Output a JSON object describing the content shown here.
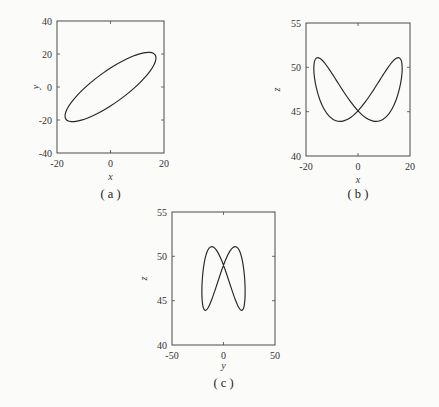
{
  "chart_data": [
    {
      "panel": "a",
      "type": "line",
      "caption": "( a )",
      "xlabel": "x",
      "ylabel": "y",
      "xlim": [
        -20,
        20
      ],
      "ylim": [
        -40,
        40
      ],
      "xticks": [
        -20,
        0,
        20
      ],
      "yticks": [
        -40,
        -20,
        0,
        20,
        40
      ],
      "grid": false,
      "x": [
        0,
        2.95,
        5.81,
        8.5,
        10.93,
        13.02,
        14.72,
        15.97,
        16.74,
        17,
        16.74,
        15.97,
        14.72,
        13.02,
        10.93,
        8.5,
        5.81,
        2.95,
        0,
        -2.95,
        -5.81,
        -8.5,
        -10.93,
        -13.02,
        -14.72,
        -15.97,
        -16.74,
        -17,
        -16.74,
        -15.97,
        -14.72,
        -13.02,
        -10.93,
        -8.5,
        -5.81,
        -2.95
      ],
      "y": [
        -11.5,
        -8.27,
        -4.8,
        -1.17,
        2.49,
        6.07,
        9.47,
        12.58,
        15.31,
        17.57,
        19.3,
        20.45,
        20.97,
        20.85,
        20.1,
        18.74,
        16.81,
        14.37,
        11.5,
        8.27,
        4.8,
        1.17,
        -2.49,
        -6.07,
        -9.47,
        -12.58,
        -15.31,
        -17.57,
        -19.3,
        -20.45,
        -20.97,
        -20.85,
        -20.1,
        -18.74,
        -16.81,
        -14.37
      ]
    },
    {
      "panel": "b",
      "type": "line",
      "caption": "( b )",
      "xlabel": "x",
      "ylabel": "z",
      "xlim": [
        -20,
        20
      ],
      "ylim": [
        40,
        55
      ],
      "xticks": [
        -20,
        0,
        20
      ],
      "yticks": [
        40,
        45,
        50,
        55
      ],
      "grid": false,
      "x": [
        0,
        2.95,
        5.81,
        8.5,
        10.93,
        13.02,
        14.72,
        15.97,
        16.74,
        17,
        16.74,
        15.97,
        14.72,
        13.02,
        10.93,
        8.5,
        5.81,
        2.95,
        0,
        -2.95,
        -5.81,
        -8.5,
        -10.93,
        -13.02,
        -14.72,
        -15.97,
        -16.74,
        -17,
        -16.74,
        -15.97,
        -14.72,
        -13.02,
        -10.93,
        -8.5,
        -5.81,
        -2.95
      ],
      "y": [
        45.1,
        46.16,
        47.38,
        48.62,
        49.72,
        50.56,
        51.02,
        51.06,
        50.68,
        49.9,
        48.84,
        47.62,
        46.38,
        45.28,
        44.44,
        43.98,
        43.94,
        44.32,
        45.1,
        46.16,
        47.38,
        48.62,
        49.72,
        50.56,
        51.02,
        51.06,
        50.68,
        49.9,
        48.84,
        47.62,
        46.38,
        45.28,
        44.44,
        43.98,
        43.94,
        44.32
      ]
    },
    {
      "panel": "c",
      "type": "line",
      "caption": "( c )",
      "xlabel": "y",
      "ylabel": "z",
      "xlim": [
        -50,
        50
      ],
      "ylim": [
        40,
        55
      ],
      "xticks": [
        -50,
        0,
        50
      ],
      "yticks": [
        40,
        45,
        50,
        55
      ],
      "grid": false,
      "x": [
        -11.5,
        -8.27,
        -4.8,
        -1.17,
        2.49,
        6.07,
        9.47,
        12.58,
        15.31,
        17.57,
        19.3,
        20.45,
        20.97,
        20.85,
        20.1,
        18.74,
        16.81,
        14.37,
        11.5,
        8.27,
        4.8,
        1.17,
        -2.49,
        -6.07,
        -9.47,
        -12.58,
        -15.31,
        -17.57,
        -19.3,
        -20.45,
        -20.97,
        -20.85,
        -20.1,
        -18.74,
        -16.81,
        -14.37
      ],
      "y": [
        45.1,
        46.16,
        47.38,
        48.62,
        49.72,
        50.56,
        51.02,
        51.06,
        50.68,
        49.9,
        48.84,
        47.62,
        46.38,
        45.28,
        44.44,
        43.98,
        43.94,
        44.32,
        45.1,
        46.16,
        47.38,
        48.62,
        49.72,
        50.56,
        51.02,
        51.06,
        50.68,
        49.9,
        48.84,
        47.62,
        46.38,
        45.28,
        44.44,
        43.98,
        43.94,
        44.32
      ]
    }
  ]
}
